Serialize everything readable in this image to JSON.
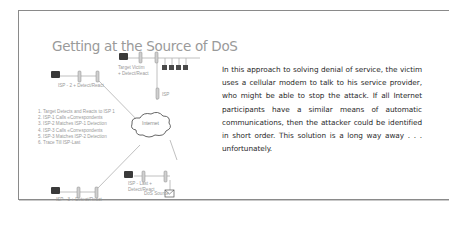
{
  "slide": {
    "title": "Getting at the Source of DoS",
    "labels": {
      "target_victim_line1": "Target Victim",
      "target_victim_line2": "+ Detect/React",
      "isp2": "ISP - 2 + Detect/React",
      "isp": "ISP",
      "internet": "Internet",
      "isp_last_line1": "ISP - Last +",
      "isp_last_line2": "Detect/React",
      "dos_source": "DoS Source",
      "isp3": "ISP - 3 + Detect/React"
    },
    "steps": [
      "1. Target Detects and Reacts to ISP 1",
      "2. ISP-1 Calls «Correspondents",
      "3. ISP-2 Matches ISP-1 Detection",
      "4. ISP-3 Calls «Correspondents",
      "5. ISP-3 Matches ISP-2 Detection",
      "6. Trace Till ISP-Last"
    ],
    "icons": [
      "telephone-icon",
      "modem-icon",
      "computer-icon",
      "cloud-icon",
      "mail-icon"
    ]
  },
  "caption": {
    "text": "In this approach to solving denial of service, the victim uses a cellular modem to talk to his service provider, who might be able to stop the attack. If all Internet participants have a similar means of automatic communications, then the attacker could be identified in short order. This solution is a long way away . . . unfortunately."
  },
  "colors": {
    "frame": "#8a8a8a",
    "diagram_gray": "#9a9a9a",
    "body_text": "#2a2a2a"
  }
}
